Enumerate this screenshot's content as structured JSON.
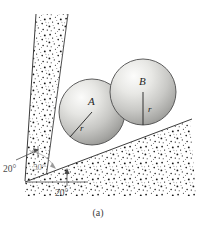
{
  "figure": {
    "caption": "(a)",
    "background_color": "#ffffff",
    "width": 197,
    "height": 230
  },
  "spheres": [
    {
      "id": "A",
      "label": "A",
      "radius_label": "r",
      "center_x": 92,
      "center_y": 112,
      "radius": 33,
      "fill_light": "#f2f2f0",
      "fill_dark": "#9a9a98",
      "stroke": "#4a4a4a"
    },
    {
      "id": "B",
      "label": "B",
      "radius_label": "r",
      "center_x": 143,
      "center_y": 92,
      "radius": 33,
      "fill_light": "#f4f4f2",
      "fill_dark": "#9c9c9a",
      "stroke": "#4a4a4a"
    }
  ],
  "angles": {
    "left_wall": "20°",
    "ground": "20°",
    "wedge_interior": "50°"
  },
  "surfaces": {
    "left_wall_name": "inclined left wall",
    "ground_name": "inclined ground plane",
    "stipple_color": "#111111",
    "edge_color": "#3c3c3c"
  },
  "colors": {
    "line": "#3c3c3c",
    "text": "#333333",
    "muted_text": "#8a8a8a"
  }
}
